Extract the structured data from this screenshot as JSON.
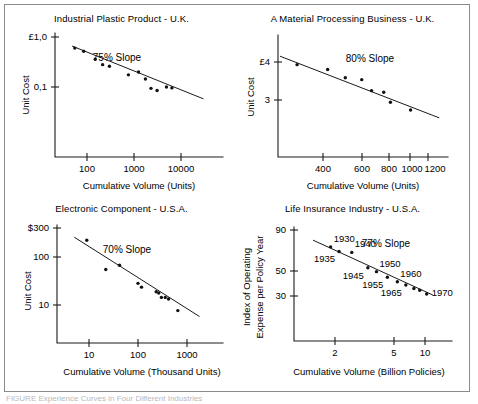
{
  "figure": {
    "caption": "FIGURE  Experience Curves in Four Different Industries",
    "frame_color": "#8a8a8a",
    "ink_color": "#111111"
  },
  "chart_data": [
    {
      "type": "scatter",
      "title": "Industrial Plastic Product - U.K.",
      "xlabel": "Cumulative Volume (Units)",
      "ylabel": "Unit Cost",
      "xscale": "log",
      "yscale": "log",
      "xlim": [
        40,
        40000
      ],
      "ylim": [
        0.03,
        1.0
      ],
      "xticks": [
        "100",
        "1000",
        "10000"
      ],
      "xtick_values": [
        100,
        1000,
        10000
      ],
      "yticks": [
        "£1,0",
        "0,1"
      ],
      "ytick_values": [
        1.0,
        0.1
      ],
      "annotation": "75% Slope",
      "grid": false,
      "points": [
        {
          "x": 55,
          "y": 0.6
        },
        {
          "x": 85,
          "y": 0.52
        },
        {
          "x": 150,
          "y": 0.36
        },
        {
          "x": 215,
          "y": 0.28
        },
        {
          "x": 300,
          "y": 0.26
        },
        {
          "x": 760,
          "y": 0.175
        },
        {
          "x": 1250,
          "y": 0.2
        },
        {
          "x": 1750,
          "y": 0.145
        },
        {
          "x": 2300,
          "y": 0.094
        },
        {
          "x": 3100,
          "y": 0.085
        },
        {
          "x": 4900,
          "y": 0.1
        },
        {
          "x": 6400,
          "y": 0.096
        }
      ],
      "fit_line": {
        "x0": 48,
        "y0": 0.66,
        "x1": 30000,
        "y1": 0.058
      }
    },
    {
      "type": "scatter",
      "title": "A Material Processing Business - U.K.",
      "xlabel": "Cumulative Volume (Units)",
      "ylabel": "Unit Cost",
      "xscale": "log",
      "yscale": "log",
      "xlim": [
        230,
        1450
      ],
      "ylim": [
        2.3,
        5.2
      ],
      "xticks": [
        "400",
        "600",
        "800",
        "1000",
        "1200"
      ],
      "xtick_values": [
        400,
        600,
        800,
        1000,
        1200
      ],
      "yticks": [
        "£4",
        "3"
      ],
      "ytick_values": [
        4,
        3
      ],
      "annotation": "80% Slope",
      "grid": false,
      "points": [
        {
          "x": 305,
          "y": 3.92
        },
        {
          "x": 420,
          "y": 3.78
        },
        {
          "x": 505,
          "y": 3.55
        },
        {
          "x": 600,
          "y": 3.5
        },
        {
          "x": 665,
          "y": 3.22
        },
        {
          "x": 755,
          "y": 3.18
        },
        {
          "x": 810,
          "y": 2.95
        },
        {
          "x": 1000,
          "y": 2.78
        }
      ],
      "fit_line": {
        "x0": 255,
        "y0": 4.18,
        "x1": 1350,
        "y1": 2.62
      }
    },
    {
      "type": "scatter",
      "title": "Electronic Component - U.S.A.",
      "xlabel": "Cumulative Volume (Thousand Units)",
      "ylabel": "Unit Cost",
      "xscale": "log",
      "yscale": "log",
      "xlim": [
        4,
        2600
      ],
      "ylim": [
        4,
        300
      ],
      "xticks": [
        "10",
        "100",
        "1000"
      ],
      "xtick_values": [
        10,
        100,
        1000
      ],
      "yticks": [
        "$300",
        "100",
        "10"
      ],
      "ytick_values": [
        300,
        100,
        10
      ],
      "annotation": "70% Slope",
      "grid": false,
      "points": [
        {
          "x": 9,
          "y": 175
        },
        {
          "x": 22,
          "y": 48
        },
        {
          "x": 42,
          "y": 58
        },
        {
          "x": 100,
          "y": 26
        },
        {
          "x": 118,
          "y": 22
        },
        {
          "x": 235,
          "y": 18
        },
        {
          "x": 265,
          "y": 17
        },
        {
          "x": 300,
          "y": 14
        },
        {
          "x": 360,
          "y": 14
        },
        {
          "x": 420,
          "y": 13
        },
        {
          "x": 650,
          "y": 7.8
        }
      ],
      "fit_line": {
        "x0": 5,
        "y0": 200,
        "x1": 1800,
        "y1": 6.0
      }
    },
    {
      "type": "scatter",
      "title": "Life Insurance Industry - U.S.A.",
      "xlabel": "Cumulative Volume (Billion Policies)",
      "ylabel": "Index of Operating\nExpense per Policy Year",
      "ylabel_line1": "Index of Operating",
      "ylabel_line2": "Expense per Policy Year",
      "xscale": "log",
      "yscale": "log",
      "xlim": [
        1.25,
        14
      ],
      "ylim": [
        26,
        95
      ],
      "xticks": [
        "2",
        "5",
        "10"
      ],
      "xtick_values": [
        2,
        5,
        10
      ],
      "yticks": [
        "90",
        "50",
        "30"
      ],
      "ytick_values": [
        90,
        50,
        30
      ],
      "annotation": "77% Slope",
      "grid": false,
      "points": [
        {
          "x": 1.85,
          "y": 68,
          "label": "1930",
          "label_pos": "above-right"
        },
        {
          "x": 2.15,
          "y": 63,
          "label": "1935",
          "label_pos": "below-left"
        },
        {
          "x": 2.7,
          "y": 62,
          "label": "1940",
          "label_pos": "above-right"
        },
        {
          "x": 3.6,
          "y": 48,
          "label": "1945",
          "label_pos": "below-left"
        },
        {
          "x": 4.2,
          "y": 45,
          "label": "1950",
          "label_pos": "above-right"
        },
        {
          "x": 5.1,
          "y": 41,
          "label": "1955",
          "label_pos": "below-left"
        },
        {
          "x": 6.1,
          "y": 38,
          "label": "1960",
          "label_pos": "above-right"
        },
        {
          "x": 7.1,
          "y": 36,
          "label": "1965",
          "label_pos": "below-left"
        },
        {
          "x": 8.2,
          "y": 34,
          "label": "",
          "label_pos": ""
        },
        {
          "x": 9.1,
          "y": 33,
          "label": "",
          "label_pos": ""
        },
        {
          "x": 10.3,
          "y": 31,
          "label": "1970",
          "label_pos": "right"
        }
      ],
      "fit_line": {
        "x0": 1.35,
        "y0": 76,
        "x1": 11.5,
        "y1": 30.5
      }
    }
  ]
}
